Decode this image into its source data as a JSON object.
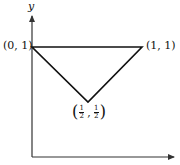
{
  "diagram": {
    "axes": {
      "y_label": "y",
      "x_label": "",
      "origin_px": [
        32,
        157
      ],
      "y_axis_top_px": [
        32,
        14
      ],
      "x_axis_right_px": [
        176,
        157
      ]
    },
    "points": [
      {
        "id": "p1",
        "label": "(0, 1)",
        "coords": [
          0,
          1
        ],
        "px": [
          32,
          47
        ]
      },
      {
        "id": "p2",
        "label": "(1, 1)",
        "coords": [
          1,
          1
        ],
        "px": [
          142,
          47
        ]
      },
      {
        "id": "p3",
        "label": "(½, ½)",
        "coords": [
          0.5,
          0.5
        ],
        "px": [
          88,
          102
        ],
        "label_parts": {
          "open": "(",
          "x_num": "1",
          "x_den": "2",
          "sep": ",",
          "y_num": "1",
          "y_den": "2",
          "close": ")"
        }
      }
    ],
    "shape": {
      "type": "triangle",
      "vertices": [
        "p1",
        "p2",
        "p3"
      ],
      "stroke": "#111111"
    },
    "colors": {
      "line": "#111111",
      "axis": "#333333",
      "background": "#ffffff"
    }
  }
}
